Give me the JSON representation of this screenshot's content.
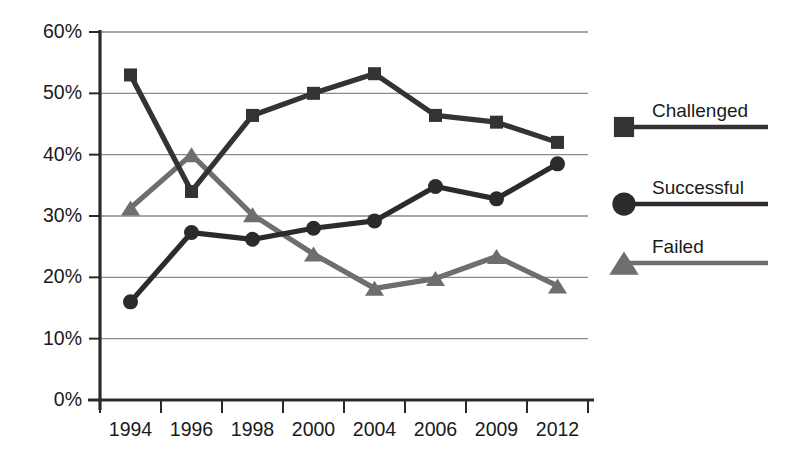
{
  "chart_data": {
    "type": "line",
    "title": "",
    "subtitle": "",
    "xlabel": "",
    "ylabel": "",
    "categories": [
      "1994",
      "1996",
      "1998",
      "2000",
      "2004",
      "2006",
      "2009",
      "2012"
    ],
    "ylim": [
      0,
      60
    ],
    "ytick_values": [
      0,
      10,
      20,
      30,
      40,
      50,
      60
    ],
    "ytick_labels": [
      "0%",
      "10%",
      "20%",
      "30%",
      "40%",
      "50%",
      "60%"
    ],
    "grid": true,
    "grid_axis": "y",
    "legend_position": "right",
    "series": [
      {
        "name": "Challenged",
        "marker": "square",
        "color": "#333333",
        "values": [
          53.0,
          34.0,
          46.4,
          50.0,
          53.2,
          46.4,
          45.3,
          42.0
        ]
      },
      {
        "name": "Successful",
        "marker": "circle",
        "color": "#2b2b2b",
        "values": [
          16.0,
          27.3,
          26.2,
          28.0,
          29.2,
          34.8,
          32.8,
          38.5
        ]
      },
      {
        "name": "Failed",
        "marker": "triangle",
        "color": "#6e6e6e",
        "values": [
          31.3,
          40.0,
          30.2,
          23.8,
          18.2,
          19.8,
          23.4,
          18.6
        ]
      }
    ]
  },
  "legend": {
    "entries": [
      {
        "label": "Challenged",
        "marker": "square-marker-icon",
        "color": "#333333"
      },
      {
        "label": "Successful",
        "marker": "circle-marker-icon",
        "color": "#2b2b2b"
      },
      {
        "label": "Failed",
        "marker": "triangle-marker-icon",
        "color": "#6e6e6e"
      }
    ]
  },
  "axes": {
    "y_axis_color": "#2a2a2a",
    "x_axis_color": "#2a2a2a",
    "gridline_color": "#8a8a8a"
  },
  "plot": {
    "background": "#ffffff"
  }
}
